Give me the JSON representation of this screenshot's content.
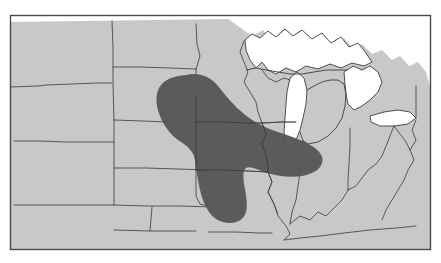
{
  "figure": {
    "kind": "thematic-map",
    "title": "",
    "caption": "",
    "width": 441,
    "height": 263
  },
  "colors": {
    "background": "#ffffff",
    "land": "#c8c8c8",
    "water": "#ffffff",
    "border": "#4a4a4a",
    "highlight": "#565656",
    "frame": "#4a4a4a"
  },
  "map": {
    "region_label": "",
    "frame": {
      "x": 10,
      "y": 15,
      "width": 421,
      "height": 235
    },
    "highlight": {
      "label": "",
      "fill": "#565656",
      "core_states": [
        "Iowa"
      ],
      "partial_states": [
        "Minnesota",
        "South Dakota",
        "Nebraska",
        "Missouri",
        "Illinois",
        "Wisconsin"
      ]
    },
    "states": [
      {
        "name": "Montana",
        "abbr": "MT",
        "shaded": false
      },
      {
        "name": "Wyoming",
        "abbr": "WY",
        "shaded": false
      },
      {
        "name": "North Dakota",
        "abbr": "ND",
        "shaded": false
      },
      {
        "name": "South Dakota",
        "abbr": "SD",
        "shaded": true
      },
      {
        "name": "Nebraska",
        "abbr": "NE",
        "shaded": true
      },
      {
        "name": "Colorado",
        "abbr": "CO",
        "shaded": false
      },
      {
        "name": "Kansas",
        "abbr": "KS",
        "shaded": false
      },
      {
        "name": "Oklahoma",
        "abbr": "OK",
        "shaded": false
      },
      {
        "name": "Minnesota",
        "abbr": "MN",
        "shaded": true
      },
      {
        "name": "Iowa",
        "abbr": "IA",
        "shaded": true
      },
      {
        "name": "Missouri",
        "abbr": "MO",
        "shaded": true
      },
      {
        "name": "Arkansas",
        "abbr": "AR",
        "shaded": false
      },
      {
        "name": "Wisconsin",
        "abbr": "WI",
        "shaded": true
      },
      {
        "name": "Illinois",
        "abbr": "IL",
        "shaded": true
      },
      {
        "name": "Michigan",
        "abbr": "MI",
        "shaded": false
      },
      {
        "name": "Indiana",
        "abbr": "IN",
        "shaded": false
      },
      {
        "name": "Ohio",
        "abbr": "OH",
        "shaded": false
      },
      {
        "name": "Kentucky",
        "abbr": "KY",
        "shaded": false
      },
      {
        "name": "Tennessee",
        "abbr": "TN",
        "shaded": false
      },
      {
        "name": "West Virginia",
        "abbr": "WV",
        "shaded": false
      }
    ],
    "water_bodies": [
      {
        "name": "Lake Superior"
      },
      {
        "name": "Lake Michigan"
      },
      {
        "name": "Lake Huron"
      },
      {
        "name": "Lake Erie"
      }
    ]
  }
}
